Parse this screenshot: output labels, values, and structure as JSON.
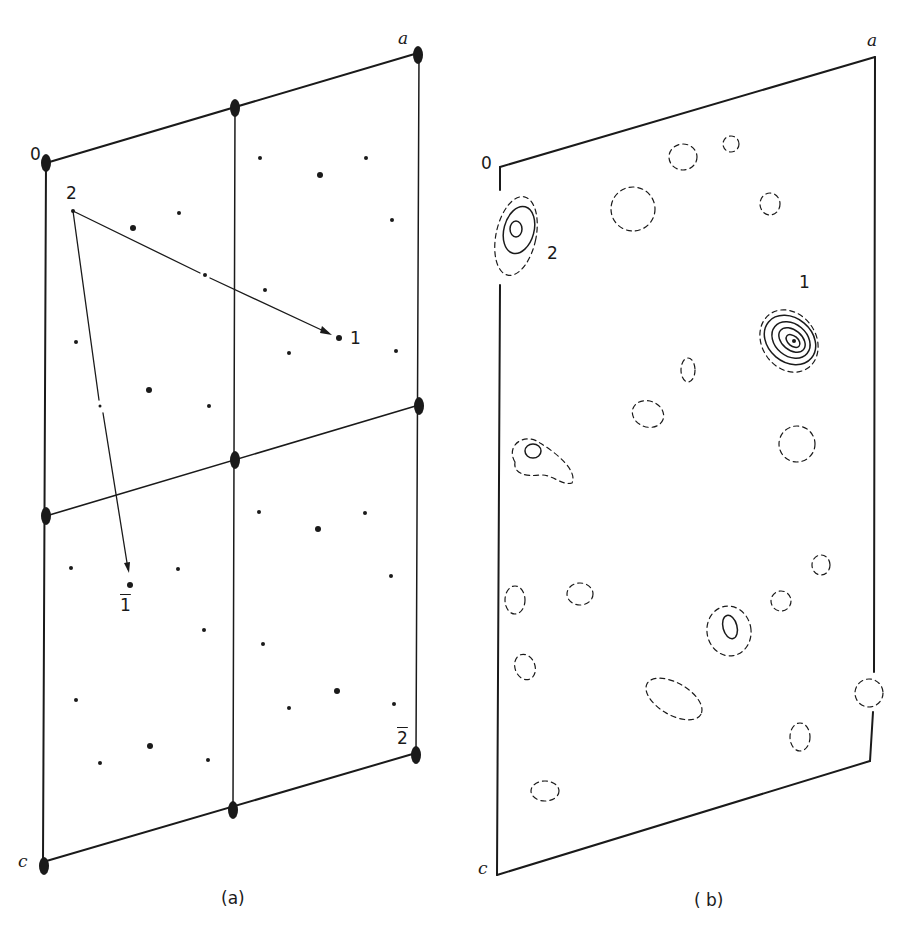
{
  "panel_a": {
    "caption": "(a)",
    "axis_labels": {
      "origin": "0",
      "a": "a",
      "c": "c"
    },
    "peak_labels": {
      "p2": "2",
      "p1": "1",
      "p1bar": "1",
      "p2bar": "2"
    }
  },
  "panel_b": {
    "caption": "( b)",
    "axis_labels": {
      "origin": "0",
      "a": "a",
      "c": "c"
    },
    "peak_labels": {
      "p2": "2",
      "p1": "1"
    }
  },
  "colors": {
    "ink": "#1a1a1a",
    "background": "#ffffff"
  }
}
